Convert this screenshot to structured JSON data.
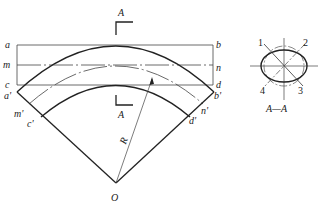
{
  "diagram": {
    "type": "pipe-bend-development",
    "main_view": {
      "rect_labels_left": [
        "a",
        "m",
        "c"
      ],
      "rect_labels_right": [
        "b",
        "n",
        "d"
      ],
      "end_labels_left": [
        "a'",
        "m'",
        "c'"
      ],
      "end_labels_right": [
        "b'",
        "n'",
        "d'"
      ],
      "section_marker_top": "A",
      "section_marker_bottom": "A",
      "radius_label": "R",
      "center_label": "O"
    },
    "section_view": {
      "point_labels": [
        "1",
        "2",
        "3",
        "4"
      ],
      "caption": "A—A"
    },
    "colors": {
      "line": "#222222",
      "thin": "#444444",
      "background": "#ffffff"
    }
  }
}
